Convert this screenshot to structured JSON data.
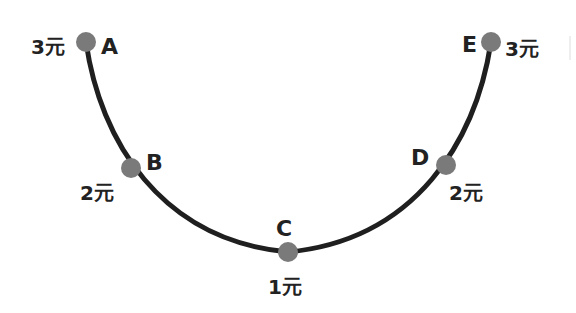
{
  "colors": {
    "curve": "#1f1f1f",
    "point": "#7a7a7a",
    "text": "#222222"
  },
  "points": [
    {
      "letter": "A",
      "price": "3元"
    },
    {
      "letter": "B",
      "price": "2元"
    },
    {
      "letter": "C",
      "price": "1元"
    },
    {
      "letter": "D",
      "price": "2元"
    },
    {
      "letter": "E",
      "price": "3元"
    }
  ]
}
